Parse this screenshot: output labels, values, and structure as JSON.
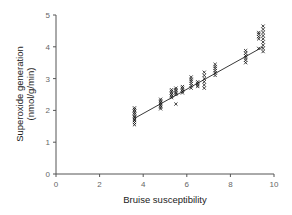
{
  "chart_data": {
    "type": "scatter",
    "title": "",
    "xlabel": "Bruise susceptibility",
    "ylabel_lines": [
      "Superoxide generation",
      "(nmol/g/min)"
    ],
    "xlim": [
      0,
      10
    ],
    "ylim": [
      0,
      5
    ],
    "xticks": [
      0,
      2,
      4,
      6,
      8,
      10
    ],
    "yticks": [
      0,
      1,
      2,
      3,
      4,
      5
    ],
    "grid": false,
    "legend": null,
    "marker": "x",
    "fit_line": {
      "x": [
        3.6,
        9.5
      ],
      "y": [
        1.75,
        4.0
      ]
    },
    "clusters": [
      {
        "x": 3.6,
        "y": [
          1.55,
          1.62,
          1.68,
          1.72,
          1.78,
          1.82,
          1.88,
          1.93,
          1.98,
          2.03,
          2.08
        ]
      },
      {
        "x": 4.8,
        "y": [
          2.05,
          2.1,
          2.15,
          2.2,
          2.25,
          2.3,
          2.35
        ]
      },
      {
        "x": 5.3,
        "y": [
          2.4,
          2.45,
          2.5,
          2.55,
          2.6,
          2.65
        ]
      },
      {
        "x": 5.5,
        "y": [
          2.2,
          2.5,
          2.55,
          2.6,
          2.65,
          2.7
        ]
      },
      {
        "x": 5.8,
        "y": [
          2.55,
          2.6,
          2.65,
          2.7,
          2.75
        ]
      },
      {
        "x": 6.2,
        "y": [
          2.7,
          2.78,
          2.85,
          2.92,
          2.98,
          3.05
        ]
      },
      {
        "x": 6.5,
        "y": [
          2.75,
          2.8,
          2.85,
          2.9
        ]
      },
      {
        "x": 6.8,
        "y": [
          2.7,
          2.8,
          2.9,
          3.0,
          3.1,
          3.2
        ]
      },
      {
        "x": 7.3,
        "y": [
          3.1,
          3.18,
          3.25,
          3.32,
          3.38,
          3.45
        ]
      },
      {
        "x": 8.7,
        "y": [
          3.5,
          3.58,
          3.65,
          3.72,
          3.8,
          3.88
        ]
      },
      {
        "x": 9.3,
        "y": [
          3.95,
          4.25,
          4.32,
          4.4,
          4.45
        ]
      },
      {
        "x": 9.5,
        "y": [
          3.85,
          3.95,
          4.05,
          4.15,
          4.25,
          4.35,
          4.45,
          4.55,
          4.65
        ]
      }
    ]
  },
  "colors": {
    "axis": "#555555",
    "marker": "#111111",
    "line": "#222222",
    "tick_text": "#666666"
  }
}
